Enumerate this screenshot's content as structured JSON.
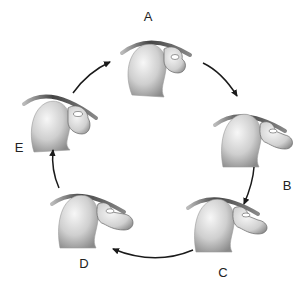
{
  "stages": [
    {
      "id": "A",
      "label": "A",
      "next": "B"
    },
    {
      "id": "B",
      "label": "B",
      "next": "C"
    },
    {
      "id": "C",
      "label": "C",
      "next": "D"
    },
    {
      "id": "D",
      "label": "D",
      "next": "E"
    },
    {
      "id": "E",
      "label": "E",
      "next": "A"
    }
  ],
  "cycle_direction": "clockwise",
  "colors": {
    "arrow": "#1a1a1a",
    "bone_light": "#f2f2f2",
    "bone_dark": "#8a8a8a",
    "label": "#222222"
  }
}
